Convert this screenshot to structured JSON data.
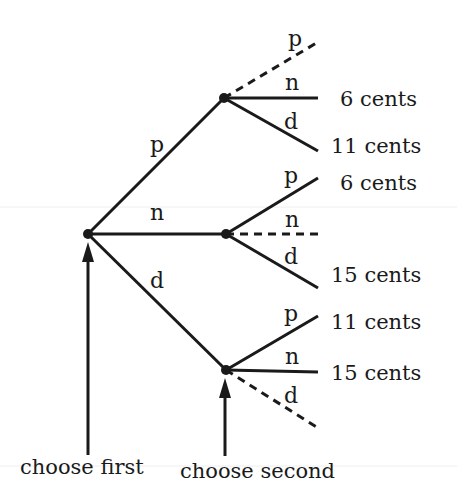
{
  "diagram": {
    "type": "tree",
    "nodes": [
      {
        "id": "root",
        "x": 88,
        "y": 234
      },
      {
        "id": "after-p",
        "x": 224,
        "y": 98
      },
      {
        "id": "after-n",
        "x": 226,
        "y": 234
      },
      {
        "id": "after-d",
        "x": 226,
        "y": 370
      }
    ],
    "first_choice_edges": [
      {
        "label": "p",
        "to": "after-p",
        "label_x": 150,
        "label_y": 152
      },
      {
        "label": "n",
        "to": "after-n",
        "label_x": 150,
        "label_y": 220
      },
      {
        "label": "d",
        "to": "after-d",
        "label_x": 150,
        "label_y": 288
      }
    ],
    "second_choice_edges": [
      {
        "from": "after-p",
        "label": "p",
        "dashed": true,
        "x2": 318,
        "y2": 42,
        "label_x": 288,
        "label_y": 46,
        "outcome": ""
      },
      {
        "from": "after-p",
        "label": "n",
        "dashed": false,
        "x2": 318,
        "y2": 98,
        "label_x": 285,
        "label_y": 90,
        "outcome": "6 cents"
      },
      {
        "from": "after-p",
        "label": "d",
        "dashed": false,
        "x2": 318,
        "y2": 151,
        "label_x": 284,
        "label_y": 129,
        "outcome": "11 cents"
      },
      {
        "from": "after-n",
        "label": "p",
        "dashed": false,
        "x2": 318,
        "y2": 178,
        "label_x": 284,
        "label_y": 183,
        "outcome": "6 cents"
      },
      {
        "from": "after-n",
        "label": "n",
        "dashed": true,
        "x2": 318,
        "y2": 234,
        "label_x": 285,
        "label_y": 227,
        "outcome": ""
      },
      {
        "from": "after-n",
        "label": "d",
        "dashed": false,
        "x2": 318,
        "y2": 288,
        "label_x": 284,
        "label_y": 264,
        "outcome": "15 cents"
      },
      {
        "from": "after-d",
        "label": "p",
        "dashed": false,
        "x2": 318,
        "y2": 316,
        "label_x": 284,
        "label_y": 321,
        "outcome": "11 cents"
      },
      {
        "from": "after-d",
        "label": "n",
        "dashed": false,
        "x2": 318,
        "y2": 372,
        "label_x": 285,
        "label_y": 364,
        "outcome": "15 cents"
      },
      {
        "from": "after-d",
        "label": "d",
        "dashed": true,
        "x2": 318,
        "y2": 428,
        "label_x": 284,
        "label_y": 403,
        "outcome": ""
      }
    ],
    "outcome_labels": [
      {
        "text": "6 cents",
        "x": 340,
        "y": 106
      },
      {
        "text": "11 cents",
        "x": 331,
        "y": 153
      },
      {
        "text": "6 cents",
        "x": 340,
        "y": 190
      },
      {
        "text": "15 cents",
        "x": 331,
        "y": 282
      },
      {
        "text": "11 cents",
        "x": 331,
        "y": 329
      },
      {
        "text": "15 cents",
        "x": 331,
        "y": 380
      }
    ],
    "captions": {
      "first": {
        "text": "choose first",
        "x": 20,
        "y": 474
      },
      "second": {
        "text": "choose second",
        "x": 180,
        "y": 478
      }
    },
    "arrows": [
      {
        "name": "choose-first-arrow",
        "x": 88,
        "y_bottom": 455,
        "y_top": 242
      },
      {
        "name": "choose-second-arrow",
        "x": 225,
        "y_bottom": 456,
        "y_top": 378
      }
    ],
    "colors": {
      "ink": "#1a1a1a",
      "background": "#ffffff"
    }
  }
}
